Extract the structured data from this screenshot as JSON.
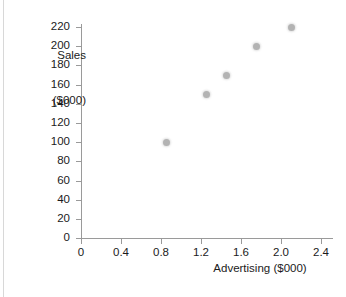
{
  "chart_data": {
    "type": "scatter",
    "title": "",
    "xlabel": "Advertising ($000)",
    "ylabel_line1": "Sales",
    "ylabel_line2": "($000)",
    "ylabel": "Sales ($000)",
    "x": [
      0.85,
      1.25,
      1.45,
      1.75,
      2.1
    ],
    "values": [
      100,
      150,
      170,
      200,
      220
    ],
    "points": [
      {
        "x": 0.85,
        "y": 100
      },
      {
        "x": 1.25,
        "y": 150
      },
      {
        "x": 1.45,
        "y": 170
      },
      {
        "x": 1.75,
        "y": 200
      },
      {
        "x": 2.1,
        "y": 220
      }
    ],
    "xlim": [
      0,
      2.6
    ],
    "ylim": [
      0,
      228
    ],
    "xticks": [
      0,
      0.4,
      0.8,
      1.2,
      1.6,
      2.0,
      2.4
    ],
    "xticklabels": [
      "0",
      "0.4",
      "0.8",
      "1.2",
      "1.6",
      "2.0",
      "2.4"
    ],
    "yticks": [
      0,
      20,
      40,
      60,
      80,
      100,
      120,
      140,
      160,
      180,
      200,
      220
    ],
    "yticklabels": [
      "0",
      "20",
      "40",
      "60",
      "80",
      "100",
      "120",
      "140",
      "160",
      "180",
      "200",
      "220"
    ],
    "grid": false,
    "legend": null,
    "marker_color": "#b3b3b3",
    "axis_color": "#9a9a9a",
    "text_color": "#1b1b1b",
    "background": "#ffffff"
  }
}
